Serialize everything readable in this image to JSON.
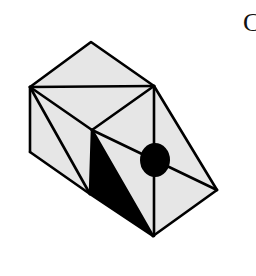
{
  "figure": {
    "corner_label": "C",
    "colors": {
      "face_fill": "#e6e6e6",
      "edge": "#000000",
      "shaded_face": "#000000",
      "dot": "#000000",
      "background": "#ffffff"
    },
    "vertices": {
      "apex": [
        91,
        42
      ],
      "left_top": [
        30,
        87
      ],
      "right_top": [
        154,
        86
      ],
      "center": [
        92,
        130
      ],
      "left_bottom": [
        30,
        152
      ],
      "bottom_mid": [
        90,
        194
      ],
      "right_far": [
        217,
        190
      ],
      "bottom_point": [
        153,
        236
      ]
    },
    "dot": {
      "cx": 155,
      "cy": 160,
      "rx": 15,
      "ry": 17
    }
  }
}
